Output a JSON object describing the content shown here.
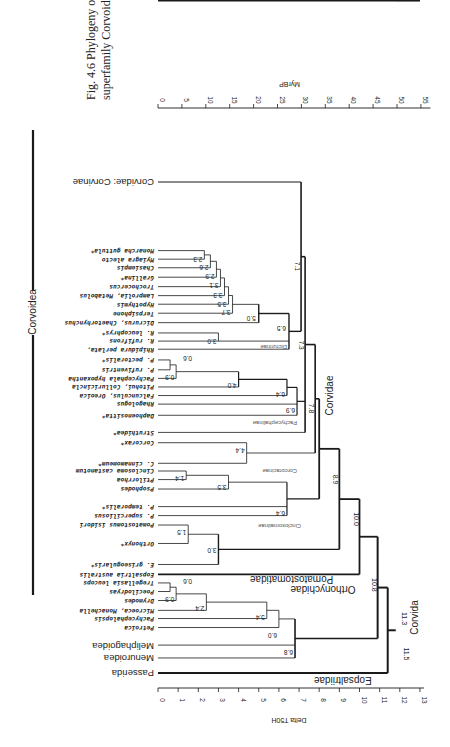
{
  "caption": {
    "line1": "Fig. 4.6  Phylogeny of the",
    "line2": "superfamily Corvoidea."
  },
  "axes": {
    "top": {
      "label": "MyrBP",
      "ticks": [
        "0",
        "5",
        "10",
        "15",
        "20",
        "25",
        "30",
        "35",
        "40",
        "45",
        "50",
        "55"
      ]
    },
    "bottom": {
      "label": "Delta T50H",
      "ticks": [
        "0",
        "1",
        "2",
        "3",
        "4",
        "5",
        "6",
        "7",
        "8",
        "9",
        "10",
        "11",
        "12",
        "13"
      ]
    }
  },
  "groups": {
    "corvoidea": "Corvoidea",
    "corvida": "Corvida",
    "corvidae": "Corvidae",
    "pomatostomatidae": "Pomatostomatidae",
    "orthonychidae": "Orthonychidae",
    "eopsaltriidae": "Eopsaltriidae",
    "dicrurinae": "Dicrurinae",
    "pachycephalinae": "Pachycephalinae",
    "corcoracinae": "Corcoracinae",
    "cinclosomatinae": "Cinclosomatinae"
  },
  "leaves": [
    {
      "label": "Corvidae: Corvinae",
      "big": true
    },
    {
      "label": "Monarcha guttula*"
    },
    {
      "label": "Myiagra alecto"
    },
    {
      "label": "Chasiempis"
    },
    {
      "label": "Grallina*"
    },
    {
      "label": "Trochocercus"
    },
    {
      "label": "Lamprolia, Metabolus"
    },
    {
      "label": "Hypothymis"
    },
    {
      "label": "Terpsiphone"
    },
    {
      "label": "Dicrurus, Chaetorhynchus"
    },
    {
      "label": "R. leucophrys*"
    },
    {
      "label": "R. rufifrons"
    },
    {
      "label": "Rhipidura perlata,"
    },
    {
      "label": "P. pectoralis*"
    },
    {
      "label": "P. rufiventris"
    },
    {
      "label": "Pachycephala hypoxantha"
    },
    {
      "label": "Pitohui, Colluricincla"
    },
    {
      "label": "Falcunculus, Oreoica"
    },
    {
      "label": "Rhagologus"
    },
    {
      "label": "Daphoenositta*"
    },
    {
      "label": "Struthidea*"
    },
    {
      "label": "Corcorax*"
    },
    {
      "label": "C. cinnamomeum*"
    },
    {
      "label": "Cinclosoma castanotum"
    },
    {
      "label": "Ptilorrhoa"
    },
    {
      "label": "Psophodes"
    },
    {
      "label": "P. temporalis*"
    },
    {
      "label": "P. superciliosus"
    },
    {
      "label": "Pomatostomus isidori"
    },
    {
      "label": "Orthonyx*"
    },
    {
      "label": "E. griseogularis*"
    },
    {
      "label": "Eopsaltria australis"
    },
    {
      "label": "Tregellasia leucops"
    },
    {
      "label": "Poecilodryas"
    },
    {
      "label": "Drymodes"
    },
    {
      "label": "Microeca, Monachella"
    },
    {
      "label": "Pachycephalopsis"
    },
    {
      "label": "Petroica"
    },
    {
      "label": "Meliphagoidea",
      "big": true
    },
    {
      "label": "Menuroidea",
      "big": true
    },
    {
      "label": "Passerida",
      "big": true
    }
  ],
  "nodes": {
    "n2_3": "2.3",
    "n2_6": "2.6",
    "n2_9": "2.9",
    "n3_1": "3.1",
    "n3_3": "3.3",
    "n3_5": "3.5",
    "n3_7": "3.7",
    "n5_0": "5.0",
    "n3_0r": "3.0",
    "n6_5": "6.5",
    "n7_1": "7.1",
    "n0_6p": "0.6",
    "n0_9p": "0.9",
    "n4_0": "4.0",
    "n6_4p": "6.4",
    "n6_9": "6.9",
    "n7_3": "7.3",
    "n4_4": "4.4",
    "n7_8": "7.8",
    "n1_4": "1.4",
    "n3_5c": "3.5",
    "n6_4c": "6.4",
    "n1_5": "1.5",
    "n3_0p": "3.0",
    "n8_9": "8.9",
    "n10_0": "10.0",
    "n0_6e": "0.6",
    "n0_9e": "0.9",
    "n2_4": "2.4",
    "n5_4": "5.4",
    "n6_0": "6.0",
    "n6_8": "6.8",
    "n10_8": "10.8",
    "n11_3": "11.3",
    "n11_5": "11.5",
    "n13_0": "13.0"
  }
}
